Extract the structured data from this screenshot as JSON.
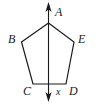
{
  "figure": {
    "background_color": "#ffffff",
    "stroke_color": "#1a1a1a",
    "width": 98,
    "height": 104
  },
  "polygon": {
    "name": "pentagon ABCDE",
    "path": "48.5,23 21.5,42 33,84 66,84 74,42",
    "vertices": [
      {
        "id": "A",
        "label": "A",
        "x": 48.5,
        "y": 23
      },
      {
        "id": "B",
        "label": "B",
        "x": 21.5,
        "y": 42
      },
      {
        "id": "C",
        "label": "C",
        "x": 33,
        "y": 84
      },
      {
        "id": "D",
        "label": "D",
        "x": 66,
        "y": 84
      },
      {
        "id": "E",
        "label": "E",
        "x": 74,
        "y": 42
      }
    ]
  },
  "labels": {
    "A": {
      "text": "A",
      "left": 55,
      "top": 6
    },
    "B": {
      "text": "B",
      "left": 8,
      "top": 33
    },
    "C": {
      "text": "C",
      "left": 23,
      "top": 85
    },
    "D": {
      "text": "D",
      "left": 69,
      "top": 85
    },
    "E": {
      "text": "E",
      "left": 78,
      "top": 33
    }
  },
  "axis": {
    "name": "vertical axis of symmetry",
    "label": "x",
    "label_left": 56,
    "label_top": 87,
    "x": 48.5,
    "y_top": 4,
    "y_bottom": 100,
    "double_headed": true
  }
}
